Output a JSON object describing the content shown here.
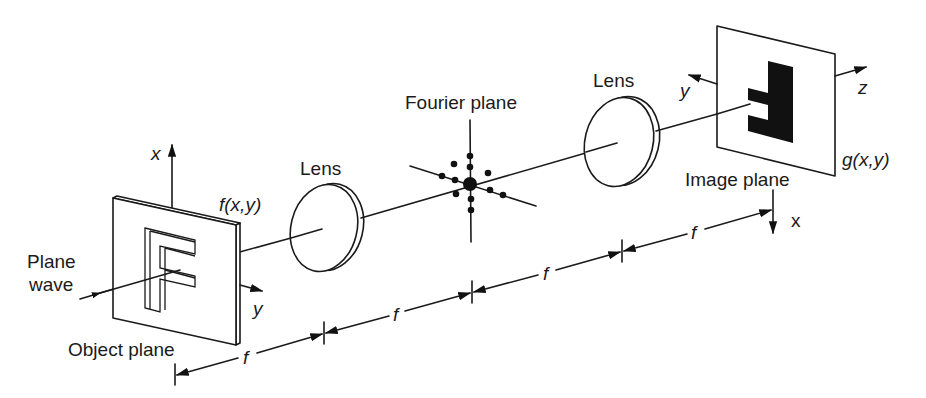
{
  "diagram": {
    "type": "optical 4f system (Fourier optics)",
    "colors": {
      "ink": "#1a1a1a",
      "background": "#ffffff"
    },
    "labels": {
      "plane_wave_line1": "Plane",
      "plane_wave_line2": "wave",
      "object_plane": "Object plane",
      "object_function": "f(x,y)",
      "lens_1": "Lens",
      "fourier_plane": "Fourier plane",
      "lens_2": "Lens",
      "image_plane": "Image plane",
      "image_function": "g(x,y)"
    },
    "axes": {
      "object_x": "x",
      "object_y": "y",
      "image_y": "y",
      "image_z": "z",
      "image_x": "x"
    },
    "distances": {
      "segment_1": "f",
      "segment_2": "f",
      "segment_3": "f",
      "segment_4": "f"
    },
    "components": [
      {
        "name": "Object plane",
        "content": "letter F (transparent cut-out)",
        "function": "f(x,y)"
      },
      {
        "name": "Lens",
        "position": "f from object plane"
      },
      {
        "name": "Fourier plane",
        "content": "diffraction spot pattern",
        "position": "2f from object plane"
      },
      {
        "name": "Lens",
        "position": "3f from object plane"
      },
      {
        "name": "Image plane",
        "content": "inverted letter F",
        "function": "g(x,y)",
        "position": "4f from object plane"
      }
    ]
  }
}
